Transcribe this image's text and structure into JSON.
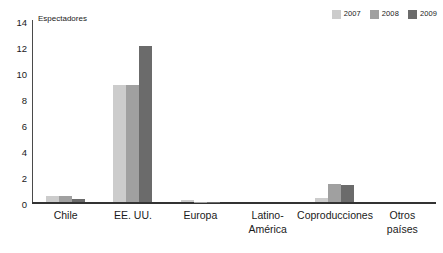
{
  "chart_data": {
    "type": "bar",
    "title": "",
    "subtitle": "",
    "xlabel": "",
    "ylabel": "Espectadores",
    "ylim": [
      0,
      14
    ],
    "ytick_step": 2,
    "yticks": [
      "14",
      "12",
      "10",
      "8",
      "6",
      "4",
      "2",
      "0"
    ],
    "ytick_values": [
      14,
      12,
      10,
      8,
      6,
      4,
      2,
      0
    ],
    "grid": false,
    "legend_position": "top-right",
    "categories": [
      "Chile",
      "EE. UU.",
      "Europa",
      "Latino-\nAmérica",
      "Coproducciones",
      "Otros\npaíses"
    ],
    "series": [
      {
        "name": "2007",
        "color": "#cccccc",
        "values": [
          0.5,
          9.0,
          0.2,
          0.0,
          0.35,
          0.0
        ]
      },
      {
        "name": "2008",
        "color": "#a0a0a0",
        "values": [
          0.5,
          9.0,
          0.05,
          0.0,
          1.4,
          0.0
        ]
      },
      {
        "name": "2009",
        "color": "#6b6b6b",
        "values": [
          0.25,
          12.0,
          0.05,
          0.0,
          1.3,
          0.0
        ]
      }
    ]
  },
  "legend": {
    "items": [
      {
        "label": "2007",
        "color": "#cccccc"
      },
      {
        "label": "2008",
        "color": "#a0a0a0"
      },
      {
        "label": "2009",
        "color": "#6b6b6b"
      }
    ]
  },
  "axis": {
    "y_title": "Espectadores"
  },
  "colors": {
    "axis_line": "#333333",
    "y_axis_line": "#4a4a4a",
    "text": "#1a1a1a",
    "background": "#ffffff"
  }
}
